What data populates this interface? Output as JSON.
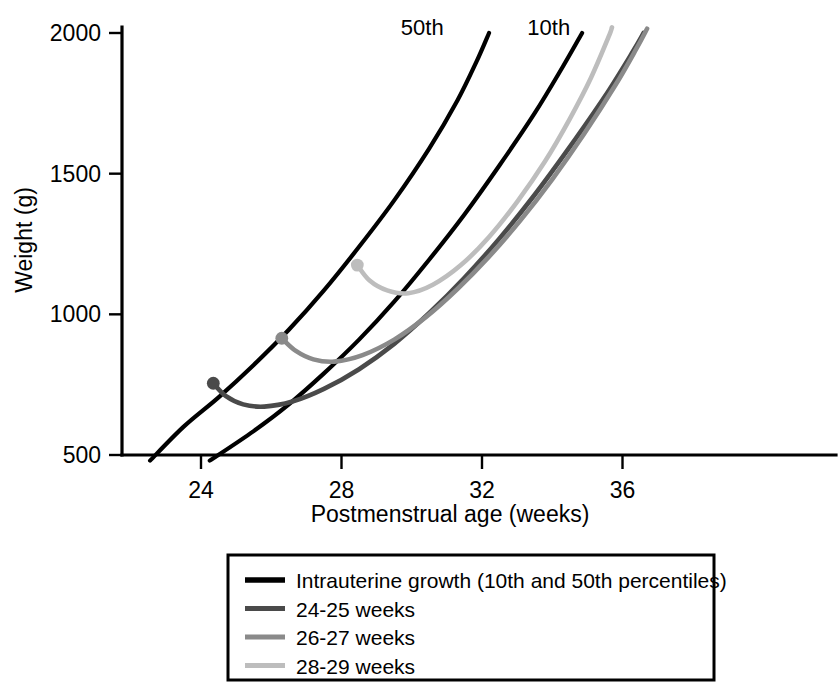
{
  "chart_data": {
    "type": "line",
    "title": "",
    "xlabel": "Postmenstrual age (weeks)",
    "ylabel": "Weight (g)",
    "xlim": [
      22.0,
      38.3
    ],
    "ylim": [
      460,
      2060
    ],
    "xticks": [
      24,
      28,
      32,
      36
    ],
    "xtick_labels": [
      "24",
      "28",
      "32",
      "36"
    ],
    "yticks": [
      500,
      1000,
      1500,
      2000
    ],
    "ytick_labels": [
      "500",
      "1000",
      "1500",
      "2000"
    ],
    "grid": false,
    "legend_position": "below-axes",
    "annotations": [
      {
        "name": "percentile-50-label",
        "text": "50th",
        "x": 30.3,
        "y": 2020
      },
      {
        "name": "percentile-10-label",
        "text": "10th",
        "x": 33.9,
        "y": 2020
      }
    ],
    "series": [
      {
        "name": "Intrauterine growth 50th percentile",
        "label": "50th",
        "color": "#000000",
        "width": 4.2,
        "points": [
          [
            22.55,
            480
          ],
          [
            23.5,
            600
          ],
          [
            24.5,
            705
          ],
          [
            25.5,
            820
          ],
          [
            26.5,
            945
          ],
          [
            27.5,
            1085
          ],
          [
            28.5,
            1240
          ],
          [
            29.5,
            1405
          ],
          [
            30.5,
            1590
          ],
          [
            31.3,
            1760
          ],
          [
            31.85,
            1900
          ],
          [
            32.2,
            2000
          ]
        ]
      },
      {
        "name": "Intrauterine growth 10th percentile",
        "label": "10th",
        "color": "#000000",
        "width": 4.2,
        "points": [
          [
            24.25,
            480
          ],
          [
            25.5,
            585
          ],
          [
            26.5,
            680
          ],
          [
            27.5,
            790
          ],
          [
            28.5,
            910
          ],
          [
            29.5,
            1045
          ],
          [
            30.5,
            1195
          ],
          [
            31.5,
            1355
          ],
          [
            32.5,
            1530
          ],
          [
            33.5,
            1715
          ],
          [
            34.3,
            1880
          ],
          [
            34.85,
            2000
          ]
        ]
      },
      {
        "name": "24-25 weeks",
        "label": "24-25 weeks",
        "color": "#4a4a4a",
        "width": 4.6,
        "marker_at_start": true,
        "points": [
          [
            24.35,
            755
          ],
          [
            24.7,
            710
          ],
          [
            25.2,
            680
          ],
          [
            25.8,
            672
          ],
          [
            26.6,
            690
          ],
          [
            27.5,
            735
          ],
          [
            28.5,
            805
          ],
          [
            29.5,
            895
          ],
          [
            30.5,
            1005
          ],
          [
            31.5,
            1130
          ],
          [
            32.5,
            1270
          ],
          [
            33.5,
            1425
          ],
          [
            34.5,
            1595
          ],
          [
            35.5,
            1775
          ],
          [
            36.3,
            1935
          ],
          [
            36.6,
            2000
          ]
        ]
      },
      {
        "name": "26-27 weeks",
        "label": "26-27 weeks",
        "color": "#8a8a8a",
        "width": 4.6,
        "marker_at_start": true,
        "points": [
          [
            26.3,
            915
          ],
          [
            26.7,
            870
          ],
          [
            27.2,
            840
          ],
          [
            27.8,
            832
          ],
          [
            28.6,
            855
          ],
          [
            29.5,
            910
          ],
          [
            30.4,
            990
          ],
          [
            31.3,
            1090
          ],
          [
            32.2,
            1205
          ],
          [
            33.1,
            1335
          ],
          [
            34.0,
            1480
          ],
          [
            34.9,
            1640
          ],
          [
            35.8,
            1815
          ],
          [
            36.4,
            1945
          ],
          [
            36.7,
            2015
          ]
        ]
      },
      {
        "name": "28-29 weeks",
        "label": "28-29 weeks",
        "color": "#bdbdbd",
        "width": 4.6,
        "marker_at_start": true,
        "points": [
          [
            28.45,
            1175
          ],
          [
            28.8,
            1120
          ],
          [
            29.3,
            1085
          ],
          [
            29.9,
            1075
          ],
          [
            30.6,
            1105
          ],
          [
            31.4,
            1175
          ],
          [
            32.2,
            1275
          ],
          [
            33.0,
            1400
          ],
          [
            33.8,
            1545
          ],
          [
            34.5,
            1695
          ],
          [
            35.1,
            1840
          ],
          [
            35.6,
            1985
          ],
          [
            35.7,
            2020
          ]
        ]
      }
    ]
  },
  "legend": {
    "entries": [
      {
        "label": "Intrauterine growth (10th and 50th percentiles)",
        "color": "#000000",
        "width": 5.5
      },
      {
        "label": "24-25 weeks",
        "color": "#4a4a4a",
        "width": 5.0
      },
      {
        "label": "26-27 weeks",
        "color": "#8a8a8a",
        "width": 5.0
      },
      {
        "label": "28-29 weeks",
        "color": "#bdbdbd",
        "width": 5.0
      }
    ]
  },
  "colors": {
    "axis": "#000000",
    "background": "#ffffff",
    "intrauterine": "#000000",
    "weeks_24_25": "#4a4a4a",
    "weeks_26_27": "#8a8a8a",
    "weeks_28_29": "#bdbdbd"
  }
}
